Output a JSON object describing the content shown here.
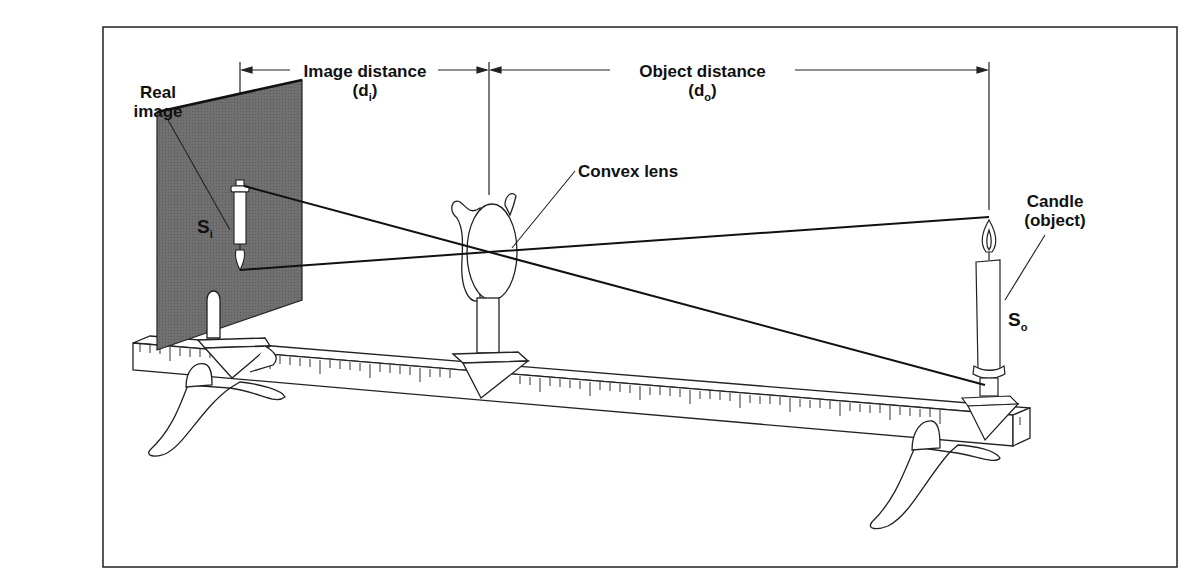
{
  "diagram": {
    "labels": {
      "real_image": [
        "Real",
        "image"
      ],
      "image_distance": "Image distance",
      "image_distance_symbol": {
        "open": "(d",
        "sub": "i",
        "close": ")"
      },
      "object_distance": "Object distance",
      "object_distance_symbol": {
        "open": "(d",
        "sub": "o",
        "close": ")"
      },
      "convex_lens": "Convex lens",
      "candle": [
        "Candle",
        "(object)"
      ],
      "image_size": {
        "base": "S",
        "sub": "i"
      },
      "object_size": {
        "base": "S",
        "sub": "o"
      }
    },
    "colors": {
      "screen": "#6e6e6e",
      "ink": "#111111",
      "background": "#ffffff"
    }
  }
}
